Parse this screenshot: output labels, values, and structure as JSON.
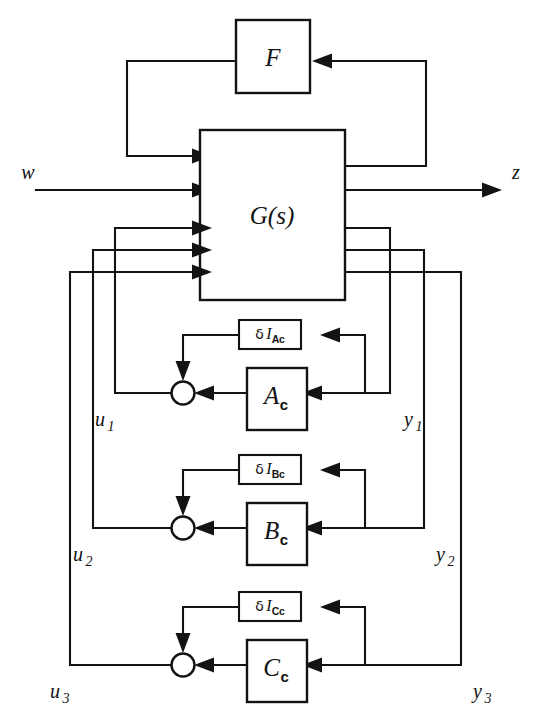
{
  "figure": {
    "type": "control-system-block-diagram",
    "background_color": "#ffffff",
    "line_color": "#131313"
  },
  "blocks": {
    "plant": {
      "label": "G(s)",
      "name": "plant-block"
    },
    "feedback": {
      "label": "F",
      "name": "feedback-block"
    },
    "controllers": [
      {
        "label": "A",
        "subscript": "c",
        "name": "controller-block-ac"
      },
      {
        "label": "B",
        "subscript": "c",
        "name": "controller-block-bc"
      },
      {
        "label": "C",
        "subscript": "c",
        "name": "controller-block-cc"
      }
    ],
    "uncertainties": [
      {
        "delta": "δ",
        "symbol": "I",
        "subscript": "Ac",
        "name": "uncertainty-block-delta-i-ac"
      },
      {
        "delta": "δ",
        "symbol": "I",
        "subscript": "Bc",
        "name": "uncertainty-block-delta-i-bc"
      },
      {
        "delta": "δ",
        "symbol": "I",
        "subscript": "Cc",
        "name": "uncertainty-block-delta-i-cc"
      }
    ]
  },
  "signals": {
    "exogenous_input": {
      "label": "w",
      "name": "signal-w"
    },
    "performance_output": {
      "label": "z",
      "name": "signal-z"
    },
    "control_inputs": [
      {
        "label": "u",
        "subscript": "1",
        "name": "signal-u1"
      },
      {
        "label": "u",
        "subscript": "2",
        "name": "signal-u2"
      },
      {
        "label": "u",
        "subscript": "3",
        "name": "signal-u3"
      }
    ],
    "measured_outputs": [
      {
        "label": "y",
        "subscript": "1",
        "name": "signal-y1"
      },
      {
        "label": "y",
        "subscript": "2",
        "name": "signal-y2"
      },
      {
        "label": "y",
        "subscript": "3",
        "name": "signal-y3"
      }
    ]
  },
  "summing_junctions": [
    {
      "name": "summing-junction-1"
    },
    {
      "name": "summing-junction-2"
    },
    {
      "name": "summing-junction-3"
    }
  ]
}
